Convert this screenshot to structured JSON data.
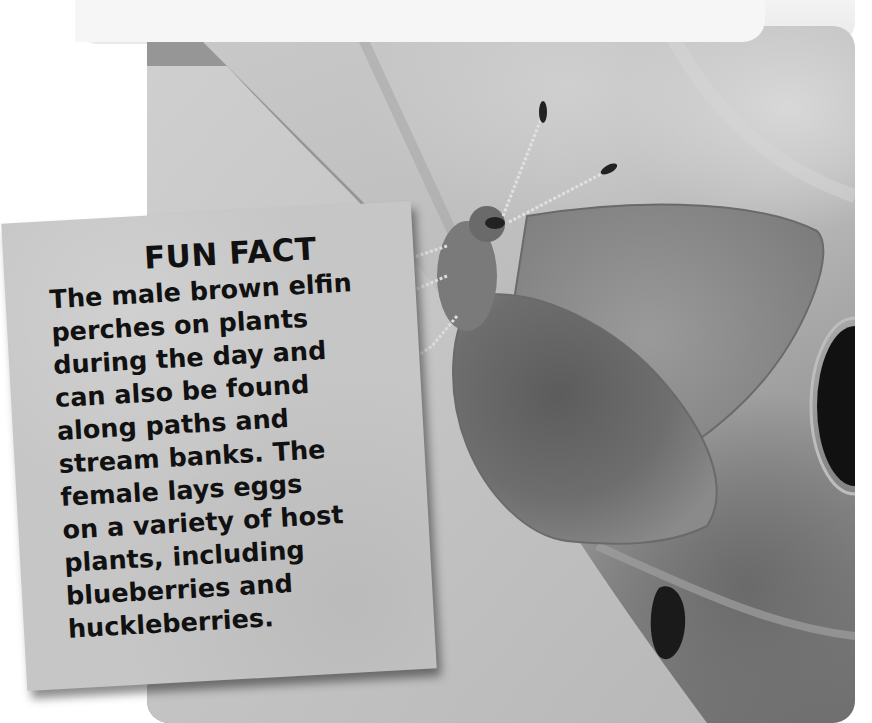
{
  "photo": {
    "subject": "brown elfin butterfly perched on a leaf",
    "colors": {
      "leaf_light": "#c8c8c8",
      "background_dark": "#6f6f6f",
      "wing": "#8a8a8a",
      "wing_dark_patch": "#5a5a5a",
      "hole": "#111111"
    }
  },
  "fun_fact": {
    "title": "FUN FACT",
    "lines": [
      "The male brown elfin",
      "perches on plants",
      "during the day and",
      "can also be found",
      "along paths and",
      "stream banks. The",
      "female lays eggs",
      "on a variety of host",
      "plants, including",
      "blueberries and",
      "huckleberries."
    ],
    "card_color": "#c6c6c6",
    "text_color": "#111111"
  }
}
